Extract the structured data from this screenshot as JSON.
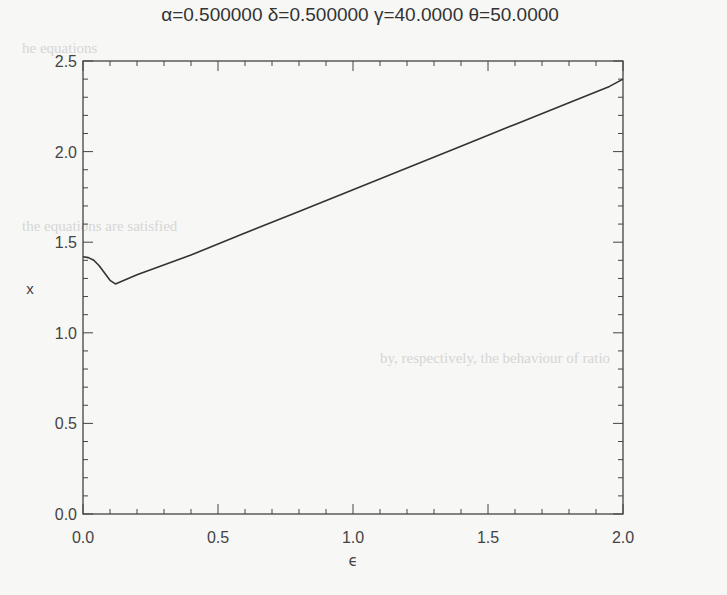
{
  "chart_data": {
    "type": "line",
    "title": "α=0.500000 δ=0.500000 γ=40.0000 θ=50.0000",
    "xlabel": "ϵ",
    "ylabel": "x",
    "xlim": [
      0.0,
      2.0
    ],
    "ylim": [
      0.0,
      2.5
    ],
    "xticks": [
      "0.0",
      "0.5",
      "1.0",
      "1.5",
      "2.0"
    ],
    "yticks": [
      "0.0",
      "0.5",
      "1.0",
      "1.5",
      "2.0",
      "2.5"
    ],
    "grid": false,
    "legend": null,
    "series": [
      {
        "name": "x(ϵ)",
        "x": [
          0.0,
          0.02,
          0.04,
          0.06,
          0.08,
          0.1,
          0.12,
          0.2,
          0.4,
          0.6,
          0.8,
          1.0,
          1.2,
          1.4,
          1.6,
          1.8,
          1.95,
          2.0
        ],
        "y": [
          1.42,
          1.415,
          1.4,
          1.37,
          1.33,
          1.29,
          1.27,
          1.32,
          1.43,
          1.55,
          1.67,
          1.79,
          1.91,
          2.03,
          2.15,
          2.27,
          2.36,
          2.4
        ]
      }
    ]
  },
  "background_text": {
    "line1": "he equations",
    "line2": "the equations are satisfied",
    "line3": "by, respectively, the behaviour of ratio"
  }
}
